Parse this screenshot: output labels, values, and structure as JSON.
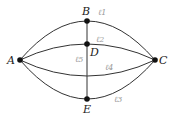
{
  "diagram": {
    "type": "graph",
    "nodes": [
      {
        "id": "A",
        "label": "A",
        "x": 20,
        "y": 60
      },
      {
        "id": "B",
        "label": "B",
        "x": 87,
        "y": 21
      },
      {
        "id": "C",
        "label": "C",
        "x": 155,
        "y": 60
      },
      {
        "id": "D",
        "label": "D",
        "x": 87,
        "y": 44
      },
      {
        "id": "E",
        "label": "E",
        "x": 87,
        "y": 99
      }
    ],
    "edges": [
      {
        "id": "l1",
        "label": "ℓ1",
        "from": "A",
        "to": "C",
        "via": "B"
      },
      {
        "id": "l2",
        "label": "ℓ2",
        "from": "A",
        "to": "C",
        "via": "D"
      },
      {
        "id": "l3",
        "label": "ℓ3",
        "from": "A",
        "to": "C",
        "via": "E"
      },
      {
        "id": "l4",
        "label": "ℓ4",
        "from": "A",
        "to": "C"
      },
      {
        "id": "l5",
        "label": "ℓ5",
        "from": "B",
        "to": "E"
      }
    ]
  }
}
